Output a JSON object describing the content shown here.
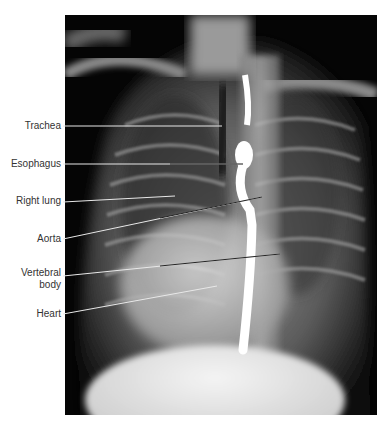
{
  "figure": {
    "type": "radiograph",
    "view": "chest x-ray with barium-filled esophagus",
    "labels": [
      {
        "id": "trachea",
        "text": "Trachea",
        "line_from": [
          63,
          126
        ],
        "line_to": [
          222,
          126
        ],
        "label_y": 120
      },
      {
        "id": "esophagus",
        "text": "Esophagus",
        "line_from": [
          63,
          164
        ],
        "line_to": [
          243,
          164
        ],
        "label_y": 158
      },
      {
        "id": "right-lung",
        "text": "Right lung",
        "line_from": [
          63,
          202
        ],
        "line_to": [
          175,
          196
        ],
        "label_y": 195
      },
      {
        "id": "aorta",
        "text": "Aorta",
        "line_from": [
          63,
          239
        ],
        "line_to": [
          262,
          197
        ],
        "label_y": 233
      },
      {
        "id": "vertebral-body",
        "text": "Vertebral\nbody",
        "line1": "Vertebral",
        "line2": "body",
        "line_from": [
          63,
          276
        ],
        "line_to": [
          280,
          254
        ],
        "label_y": 267
      },
      {
        "id": "heart",
        "text": "Heart",
        "line_from": [
          63,
          314
        ],
        "line_to": [
          217,
          286
        ],
        "label_y": 308
      }
    ],
    "colors": {
      "background": "#ffffff",
      "film": "#050505",
      "label_text": "#333333",
      "leader_line_dark": "#222222",
      "leader_line_light": "#e8e8e8"
    }
  }
}
